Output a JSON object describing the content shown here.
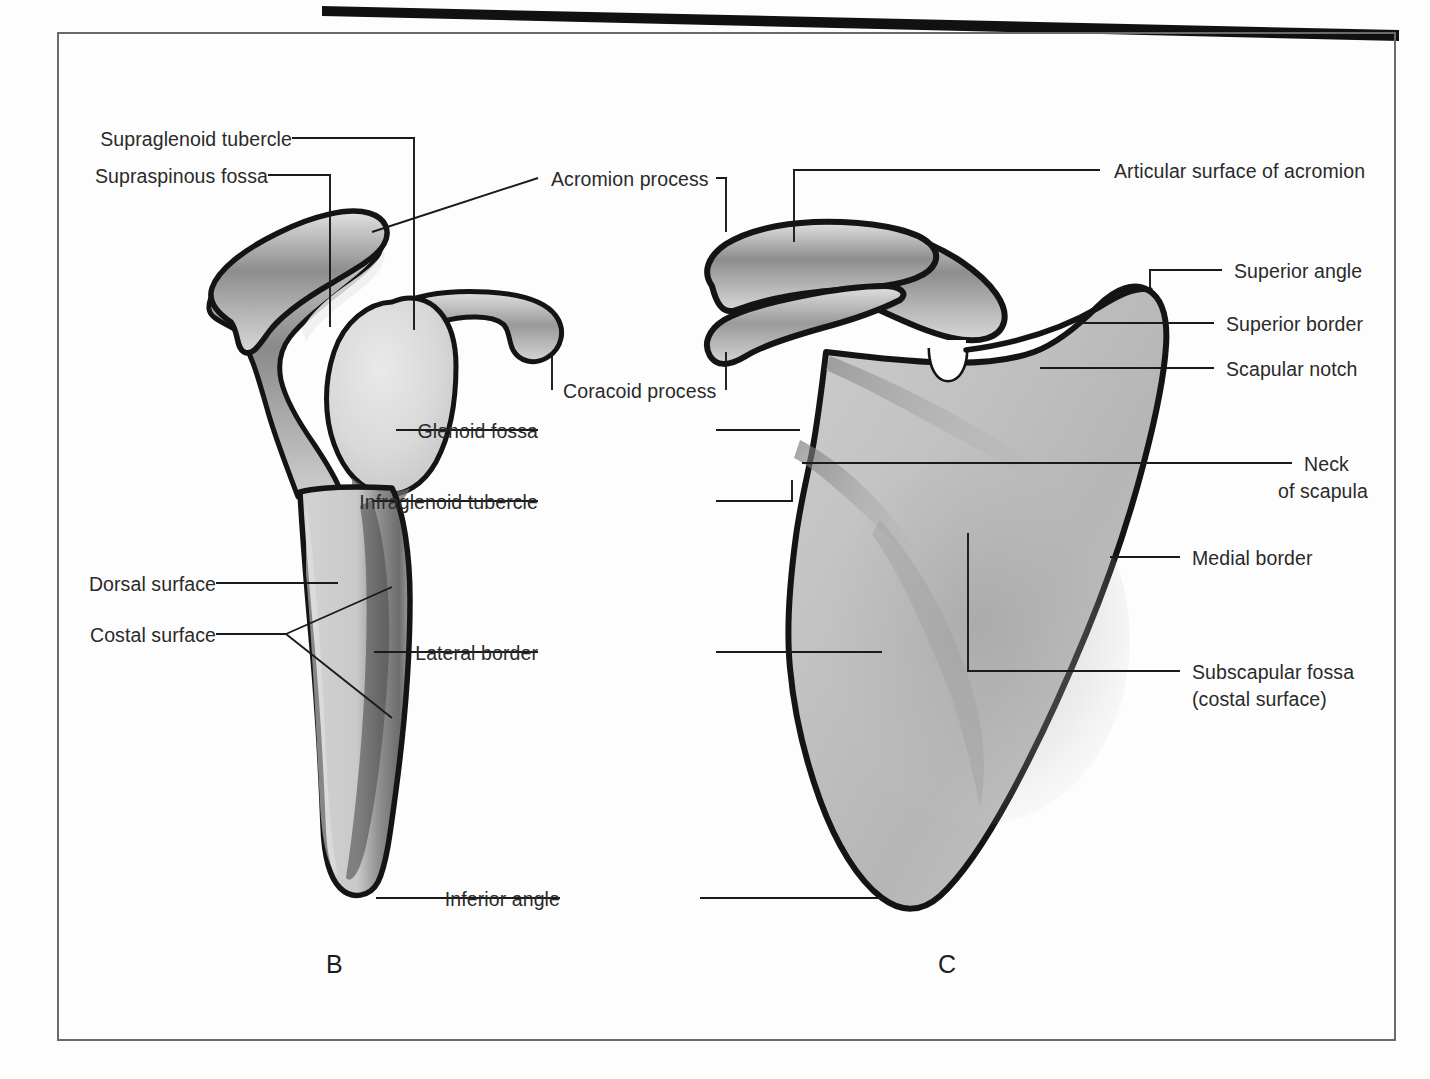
{
  "plate": {
    "title": "Scapula — lateral and anterior (costal) views",
    "background_color": "#fdfdfd",
    "frame_color": "#5a5a5a",
    "rule_color": "#101010",
    "bone_outline_color": "#111111",
    "bone_fill_color": "#cfcfcf",
    "leader_color": "#1a1a1a",
    "text_color": "#2a2a2a"
  },
  "figures": [
    {
      "letter": "B",
      "caption": "B",
      "view": "lateral view of scapula"
    },
    {
      "letter": "C",
      "caption": "C",
      "view": "anterior (costal) view of scapula"
    }
  ],
  "labels": {
    "supraglenoid_tubercle": "Supraglenoid tubercle",
    "supraspinous_fossa": "Supraspinous fossa",
    "acromion_process": "Acromion process",
    "coracoid_process": "Coracoid process",
    "glenoid_fossa": "Glenoid fossa",
    "infraglenoid_tubercle": "Infraglenoid tubercle",
    "dorsal_surface": "Dorsal surface",
    "costal_surface": "Costal surface",
    "lateral_border": "Lateral border",
    "inferior_angle": "Inferior angle",
    "articular_surface_of_acromion": "Articular surface of acromion",
    "superior_angle": "Superior angle",
    "superior_border": "Superior border",
    "scapular_notch": "Scapular notch",
    "neck_of_scapula_line1": "Neck",
    "neck_of_scapula_line2": "of scapula",
    "medial_border": "Medial border",
    "subscapular_fossa_line1": "Subscapular fossa",
    "subscapular_fossa_line2": "(costal surface)"
  }
}
